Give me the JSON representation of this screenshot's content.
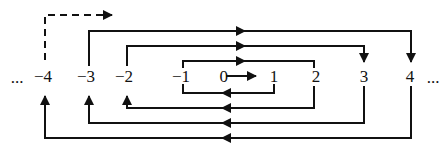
{
  "diagram": {
    "labels": {
      "ellipsis_left": "...",
      "n_neg4": "−4",
      "n_neg3": "−3",
      "n_neg2": "−2",
      "n_neg1": "−1",
      "n_0": "0",
      "n_1": "1",
      "n_2": "2",
      "n_3": "3",
      "n_4": "4",
      "ellipsis_right": "..."
    },
    "sequence": [
      "0",
      "1",
      "−1",
      "2",
      "−2",
      "3",
      "−3",
      "4",
      "−4",
      "..."
    ],
    "colors": {
      "line": "#111111",
      "background": "#ffffff"
    }
  }
}
